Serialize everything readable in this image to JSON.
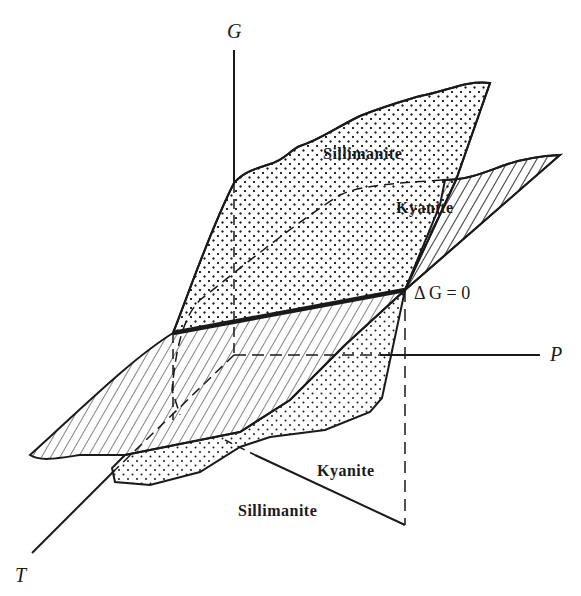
{
  "figure": {
    "axes": {
      "g_label": "G",
      "p_label": "P",
      "t_label": "T"
    },
    "upper_labels": {
      "sillimanite": "Sillimanite",
      "kyanite": "Kyanite"
    },
    "equilibrium_label": "Δ G = 0",
    "lower_labels": {
      "kyanite": "Kyanite",
      "sillimanite": "Sillimanite"
    },
    "patterns": {
      "sillimanite": "stippled",
      "kyanite": "hatched"
    },
    "colors": {
      "line": "#1a1a1a",
      "background": "#ffffff"
    }
  }
}
